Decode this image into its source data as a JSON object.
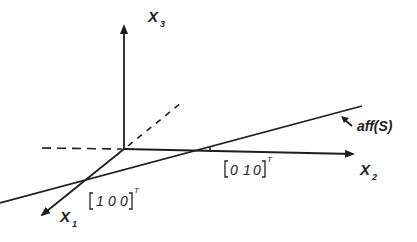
{
  "diagram": {
    "type": "3d-coordinate-axes-with-line",
    "stroke_color": "#1e1e1e",
    "axes": [
      {
        "id": "x3",
        "label": "X",
        "subscript": "3",
        "direction": "up"
      },
      {
        "id": "x2",
        "label": "X",
        "subscript": "2",
        "direction": "right"
      },
      {
        "id": "x1",
        "label": "X",
        "subscript": "1",
        "direction": "down-left"
      }
    ],
    "points": [
      {
        "id": "e1",
        "text": "[1 0 0]",
        "superscript": "T",
        "entries": [
          "1",
          "0",
          "0"
        ]
      },
      {
        "id": "e2",
        "text": "[0 1 0]",
        "superscript": "T",
        "entries": [
          "0",
          "1",
          "0"
        ]
      }
    ],
    "line": {
      "label": "aff(S)",
      "description": "affine hull through e1 and e2"
    },
    "dashed_negative_axes": [
      "x1",
      "x2"
    ]
  }
}
